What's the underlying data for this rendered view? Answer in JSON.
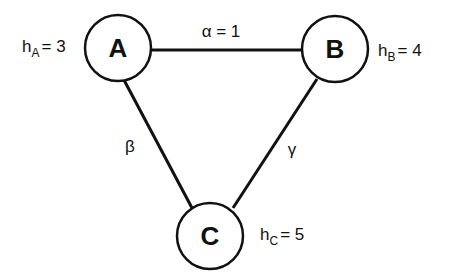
{
  "diagram": {
    "nodes": [
      {
        "id": "A",
        "label": "A",
        "cx": 118,
        "cy": 48,
        "r": 33,
        "h_var": "h",
        "h_sub": "A",
        "h_value": "= 3"
      },
      {
        "id": "B",
        "label": "B",
        "cx": 335,
        "cy": 49,
        "r": 33,
        "h_var": "h",
        "h_sub": "B",
        "h_value": "= 4"
      },
      {
        "id": "C",
        "label": "C",
        "cx": 210,
        "cy": 236,
        "r": 33,
        "h_var": "h",
        "h_sub": "C",
        "h_value": "= 5"
      }
    ],
    "edges": [
      {
        "from": "A",
        "to": "B",
        "label": "α = 1"
      },
      {
        "from": "A",
        "to": "C",
        "label": "β"
      },
      {
        "from": "B",
        "to": "C",
        "label": "γ"
      }
    ],
    "colors": {
      "stroke": "#111111",
      "background": "#ffffff"
    }
  }
}
